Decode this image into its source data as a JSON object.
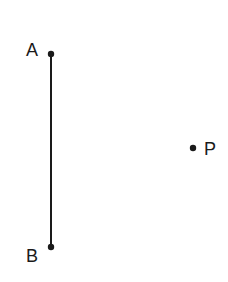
{
  "diagram": {
    "points": [
      {
        "label": "A",
        "x": 51,
        "y": 54
      },
      {
        "label": "B",
        "x": 51,
        "y": 247
      },
      {
        "label": "P",
        "x": 193,
        "y": 148
      }
    ],
    "segments": [
      {
        "from": "A",
        "to": "B"
      }
    ],
    "colors": {
      "stroke": "#1a1a1a",
      "background": "#ffffff"
    }
  }
}
